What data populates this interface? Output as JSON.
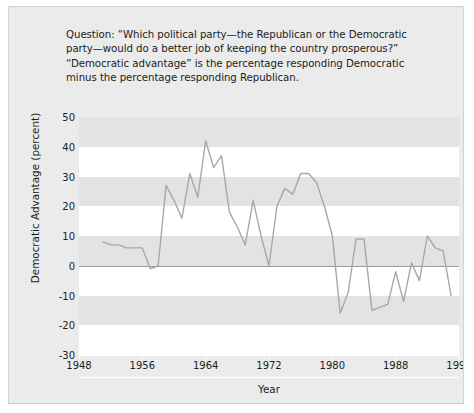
{
  "caption": {
    "lines": [
      "Question: “Which political party—the Republican or the Democratic",
      "party—would do a better job of keeping the country prosperous?”",
      "“Democratic advantage” is the percentage responding Democratic",
      "minus the percentage responding Republican."
    ]
  },
  "colors": {
    "figure_background": "#ebebeb",
    "plot_background": "#ffffff",
    "band": "#e3e3e3",
    "series_line": "#a8a8a8",
    "zero_line": "#9a9a9a",
    "text": "#1c1c1c"
  },
  "chart_data": {
    "type": "line",
    "title": "",
    "xlabel": "Year",
    "ylabel": "Democratic Advantage (percent)",
    "xlim": [
      1948,
      1996
    ],
    "ylim": [
      -30,
      50
    ],
    "xticks": [
      1948,
      1956,
      1964,
      1972,
      1980,
      1988,
      1996
    ],
    "yticks": [
      50,
      40,
      30,
      20,
      10,
      0,
      -10,
      -20,
      -30
    ],
    "grid": "horizontal-bands",
    "legend": "none",
    "series": [
      {
        "name": "Democratic advantage",
        "color": "#a8a8a8",
        "x": [
          1951,
          1952,
          1953,
          1954,
          1955,
          1956,
          1957,
          1958,
          1959,
          1960,
          1961,
          1962,
          1963,
          1964,
          1965,
          1966,
          1967,
          1968,
          1969,
          1970,
          1971,
          1972,
          1973,
          1974,
          1975,
          1976,
          1977,
          1978,
          1979,
          1980,
          1981,
          1982,
          1983,
          1984,
          1985,
          1986,
          1987,
          1988,
          1989,
          1990,
          1991,
          1992,
          1993,
          1994,
          1995
        ],
        "y": [
          8,
          7,
          7,
          6,
          6,
          6,
          -1,
          0,
          27,
          22,
          16,
          31,
          23,
          42,
          33,
          37,
          18,
          13,
          7,
          22,
          10,
          0,
          20,
          26,
          24,
          31,
          31,
          28,
          20,
          10,
          -16,
          -9,
          9,
          9,
          -15,
          -14,
          -13,
          -2,
          -12,
          1,
          -5,
          10,
          6,
          5,
          -10
        ]
      }
    ]
  },
  "axes": {
    "y_tick_labels": [
      "50",
      "40",
      "30",
      "20",
      "10",
      "0",
      "-10",
      "-20",
      "-30"
    ],
    "x_tick_labels": [
      "1948",
      "1956",
      "1964",
      "1972",
      "1980",
      "1988",
      "1996"
    ],
    "y_title": "Democratic Advantage (percent)",
    "x_title": "Year"
  }
}
